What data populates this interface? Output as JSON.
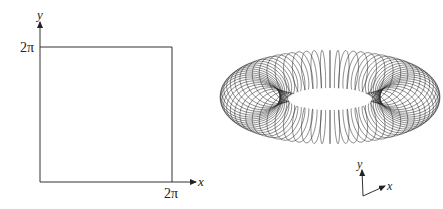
{
  "left_panel": {
    "description": "Square fundamental domain in the xy-plane",
    "x_axis_label": "x",
    "y_axis_label": "y",
    "x_tick_label": "2π",
    "y_tick_label": "2π"
  },
  "right_panel": {
    "description": "Torus surface drawn with meridian curves",
    "axis_labels": {
      "x": "x",
      "y": "y"
    },
    "meridian_count": 72
  },
  "colors": {
    "ink": "#222222",
    "background": "#ffffff"
  }
}
